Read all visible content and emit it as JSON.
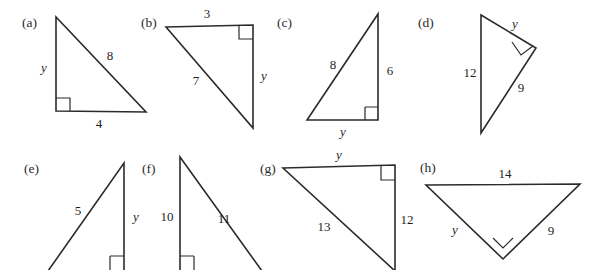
{
  "figure": {
    "background_color": "#ffffff",
    "stroke_color": "#2b2b2b",
    "text_color": "#1f1f1f",
    "unknown_symbol": "y",
    "panels": [
      {
        "id": "a",
        "letter": "(a)",
        "right_angle_at": "bottom-left",
        "labels": {
          "leg_vertical": "y",
          "hypotenuse": "8",
          "leg_horizontal": "4"
        }
      },
      {
        "id": "b",
        "letter": "(b)",
        "right_angle_at": "top-right",
        "labels": {
          "leg_top": "3",
          "leg_vertical": "y",
          "hypotenuse": "7"
        }
      },
      {
        "id": "c",
        "letter": "(c)",
        "right_angle_at": "bottom-right",
        "labels": {
          "hypotenuse": "8",
          "leg_vertical": "6",
          "leg_horizontal": "y"
        }
      },
      {
        "id": "d",
        "letter": "(d)",
        "right_angle_at": "right",
        "labels": {
          "leg_upper": "y",
          "hypotenuse": "12",
          "leg_lower": "9"
        }
      },
      {
        "id": "e",
        "letter": "(e)",
        "right_angle_at": "bottom-right",
        "labels": {
          "hypotenuse": "5",
          "leg_vertical": "y"
        }
      },
      {
        "id": "f",
        "letter": "(f)",
        "right_angle_at": "bottom-left",
        "labels": {
          "leg_vertical": "10",
          "hypotenuse": "11"
        }
      },
      {
        "id": "g",
        "letter": "(g)",
        "right_angle_at": "top-right",
        "labels": {
          "leg_top": "y",
          "leg_vertical": "12",
          "hypotenuse": "13"
        }
      },
      {
        "id": "h",
        "letter": "(h)",
        "right_angle_at": "bottom",
        "labels": {
          "hypotenuse": "14",
          "leg_left": "y",
          "leg_right": "9"
        }
      }
    ]
  }
}
